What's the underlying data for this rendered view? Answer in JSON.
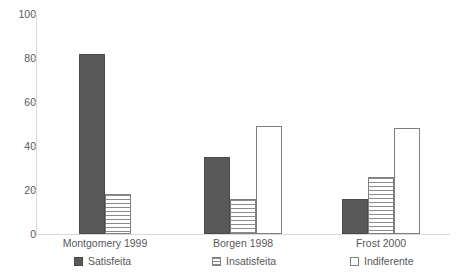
{
  "chart_data": {
    "type": "bar",
    "title": "",
    "subtitle": "",
    "xlabel": "",
    "ylabel": "",
    "ylim": [
      0,
      100
    ],
    "ytick_labels": [
      "0",
      "20",
      "40",
      "60",
      "80",
      "100"
    ],
    "ytick_values": [
      0,
      20,
      40,
      60,
      80,
      100
    ],
    "grid": false,
    "legend_position": "bottom",
    "categories": [
      "Montgomery 1999",
      "Borgen 1998",
      "Frost 2000"
    ],
    "series": [
      {
        "name": "Satisfeita",
        "pattern": "solid-dark-gray",
        "color": "#595959",
        "values": [
          82,
          35,
          16
        ]
      },
      {
        "name": "Insatisfeita",
        "pattern": "horizontal-lines",
        "color": "#8c8c8c",
        "values": [
          18,
          16,
          26
        ]
      },
      {
        "name": "Indiferente",
        "pattern": "dotted",
        "color": "#ffffff",
        "values": [
          null,
          49,
          48
        ]
      }
    ]
  },
  "axis": {
    "y_ticks": [
      {
        "label": "100",
        "value": 100
      },
      {
        "label": "80",
        "value": 80
      },
      {
        "label": "60",
        "value": 60
      },
      {
        "label": "40",
        "value": 40
      },
      {
        "label": "20",
        "value": 20
      },
      {
        "label": "0",
        "value": 0
      }
    ]
  },
  "legend": {
    "items": [
      {
        "label": "Satisfeita",
        "swatch": "satisfeita"
      },
      {
        "label": "Insatisfeita",
        "swatch": "insatisfeita"
      },
      {
        "label": "Indiferente",
        "swatch": "indiferente"
      }
    ]
  },
  "categories": [
    {
      "label": "Montgomery 1999"
    },
    {
      "label": "Borgen 1998"
    },
    {
      "label": "Frost 2000"
    }
  ]
}
